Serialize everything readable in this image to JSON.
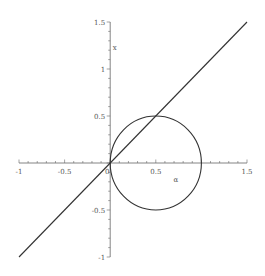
{
  "chart_data": {
    "type": "line",
    "title": "",
    "xlabel": "α",
    "ylabel": "x",
    "xlim": [
      -1,
      1.5
    ],
    "ylim": [
      -1,
      1.5
    ],
    "grid": false,
    "legend": null,
    "x_ticks": [
      {
        "value": -1,
        "label": "-1"
      },
      {
        "value": -0.5,
        "label": "-0.5"
      },
      {
        "value": 0,
        "label": "0"
      },
      {
        "value": 0.5,
        "label": "0.5"
      },
      {
        "value": 1.5,
        "label": "1.5"
      }
    ],
    "y_ticks": [
      {
        "value": -1,
        "label": "-1"
      },
      {
        "value": -0.5,
        "label": "-0.5"
      },
      {
        "value": 0.5,
        "label": "0.5"
      },
      {
        "value": 1,
        "label": "1"
      },
      {
        "value": 1.5,
        "label": "1.5"
      }
    ],
    "series": [
      {
        "name": "line y = x",
        "kind": "line",
        "x": [
          -1,
          1.5
        ],
        "y": [
          -1,
          1.5
        ]
      },
      {
        "name": "circle (x-0.5)^2 + y^2 = 0.25",
        "kind": "circle",
        "center": [
          0.5,
          0
        ],
        "radius": 0.5
      }
    ],
    "annotations": [
      {
        "text": "x",
        "x": 0.05,
        "y": 1.2,
        "role": "y-axis label"
      },
      {
        "text": "α",
        "x": 0.72,
        "y": -0.2,
        "role": "x-axis label"
      }
    ],
    "style": {
      "curve_color": "#333333",
      "axis_color": "#666666",
      "text_color": "#555555"
    }
  }
}
